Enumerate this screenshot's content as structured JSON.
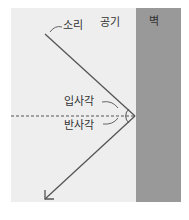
{
  "labels": {
    "sound": "소리",
    "air": "공기",
    "wall": "벽",
    "incidence_angle": "입사각",
    "reflection_angle": "반사각"
  },
  "colors": {
    "air_bg": "#eeeeee",
    "wall": "#999999",
    "line": "#555555"
  }
}
